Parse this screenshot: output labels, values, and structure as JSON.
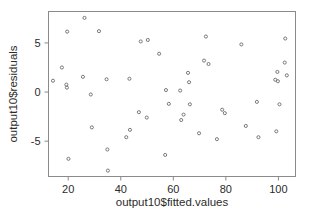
{
  "chart_data": {
    "type": "scatter",
    "title": "",
    "xlabel": "output10$fitted.values",
    "ylabel": "output10$residuals",
    "xlim": [
      12.5,
      106.5
    ],
    "ylim": [
      -8.6,
      8.2
    ],
    "xticks": [
      20,
      40,
      60,
      80,
      100
    ],
    "xtick_labels": [
      "20",
      "40",
      "60",
      "80",
      "100"
    ],
    "yticks": [
      5,
      0,
      -5
    ],
    "ytick_labels": [
      "5",
      "0",
      "-5"
    ],
    "grid": false,
    "legend": null,
    "marker": {
      "shape": "open-circle",
      "color": "#6b6b6b",
      "size": 3.1,
      "stroke_width": 0.9
    },
    "frame": {
      "color": "#8a8a8a",
      "stroke_width": 1
    },
    "points": [
      {
        "x": 14.2,
        "y": 1.15
      },
      {
        "x": 17.6,
        "y": 2.5
      },
      {
        "x": 19.3,
        "y": 0.75
      },
      {
        "x": 19.5,
        "y": 0.45
      },
      {
        "x": 19.6,
        "y": 6.15
      },
      {
        "x": 20.1,
        "y": -6.8
      },
      {
        "x": 25.6,
        "y": 1.55
      },
      {
        "x": 26.2,
        "y": 7.55
      },
      {
        "x": 28.6,
        "y": -0.25
      },
      {
        "x": 29.0,
        "y": -3.6
      },
      {
        "x": 31.7,
        "y": 6.2
      },
      {
        "x": 34.6,
        "y": 1.3
      },
      {
        "x": 34.9,
        "y": -5.85
      },
      {
        "x": 35.1,
        "y": -8.0
      },
      {
        "x": 42.1,
        "y": -4.6
      },
      {
        "x": 43.3,
        "y": 1.35
      },
      {
        "x": 43.5,
        "y": -3.85
      },
      {
        "x": 46.9,
        "y": -2.05
      },
      {
        "x": 47.6,
        "y": 5.15
      },
      {
        "x": 49.9,
        "y": -2.6
      },
      {
        "x": 50.3,
        "y": 5.3
      },
      {
        "x": 54.6,
        "y": 3.9
      },
      {
        "x": 56.9,
        "y": -6.4
      },
      {
        "x": 57.2,
        "y": 0.2
      },
      {
        "x": 58.3,
        "y": -1.2
      },
      {
        "x": 62.6,
        "y": 0.15
      },
      {
        "x": 63.0,
        "y": -2.85
      },
      {
        "x": 63.9,
        "y": -2.3
      },
      {
        "x": 65.6,
        "y": 1.95
      },
      {
        "x": 66.0,
        "y": 1.0
      },
      {
        "x": 66.3,
        "y": -1.25
      },
      {
        "x": 69.8,
        "y": -4.2
      },
      {
        "x": 71.7,
        "y": 3.2
      },
      {
        "x": 72.4,
        "y": 5.65
      },
      {
        "x": 73.4,
        "y": 2.85
      },
      {
        "x": 76.6,
        "y": -4.8
      },
      {
        "x": 78.6,
        "y": -1.8
      },
      {
        "x": 79.6,
        "y": -2.15
      },
      {
        "x": 85.9,
        "y": 4.85
      },
      {
        "x": 87.6,
        "y": -3.45
      },
      {
        "x": 91.8,
        "y": -1.0
      },
      {
        "x": 92.4,
        "y": -4.6
      },
      {
        "x": 98.8,
        "y": 1.25
      },
      {
        "x": 99.2,
        "y": -4.0
      },
      {
        "x": 99.6,
        "y": 2.05
      },
      {
        "x": 99.8,
        "y": 1.1
      },
      {
        "x": 100.4,
        "y": -1.25
      },
      {
        "x": 102.4,
        "y": 3.0
      },
      {
        "x": 102.6,
        "y": 5.45
      },
      {
        "x": 103.2,
        "y": 1.7
      }
    ]
  },
  "axes": {
    "x_axis_label": "output10$fitted.values",
    "y_axis_label": "output10$residuals"
  }
}
